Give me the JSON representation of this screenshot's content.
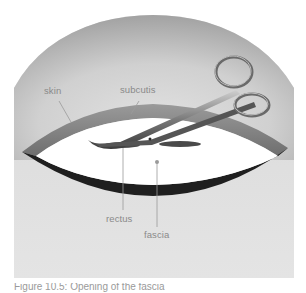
{
  "figure": {
    "labels": {
      "skin": "skin",
      "subcutis": "subcutis",
      "rectus": "rectus",
      "fascia": "fascia"
    },
    "caption": "Figure 10.5: Opening of the fascia",
    "instrument": "surgical scissors",
    "colors": {
      "background_panel": "#d9d9d9",
      "dome_shade": "#a8a8a8",
      "skin_layer": "#7f7f7f",
      "fascia_opening": "#ffffff",
      "muscle_edge": "#1f1f1f",
      "leader_line": "#9a9a9a",
      "label_text": "#8a8a8a"
    }
  }
}
